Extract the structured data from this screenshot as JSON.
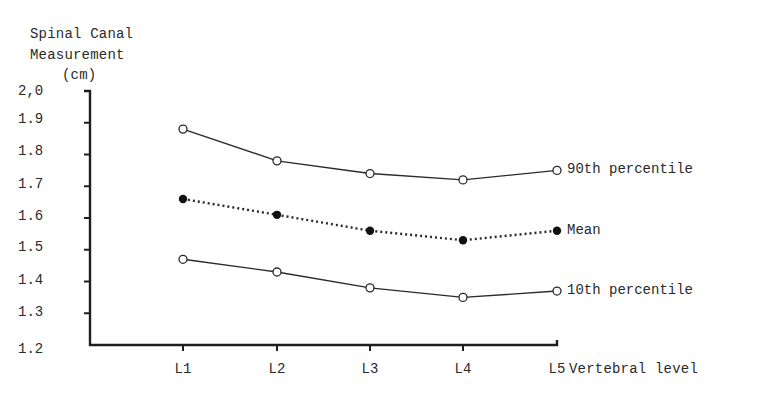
{
  "chart_data": {
    "type": "line",
    "title": "",
    "ylabel_lines": [
      "Spinal Canal",
      "Measurement",
      "(cm)"
    ],
    "xlabel": "Vertebral level",
    "categories": [
      "L1",
      "L2",
      "L3",
      "L4",
      "L5"
    ],
    "ylim": [
      1.2,
      2.0
    ],
    "yticks": [
      "2,0",
      "1.9",
      "1.8",
      "1.7",
      "1.6",
      "1.5",
      "1.4",
      "1.3",
      "1.2"
    ],
    "grid": false,
    "legend_position": "inline-right",
    "series": [
      {
        "name": "90th percentile",
        "style": "solid",
        "marker": "open-circle",
        "values": [
          1.88,
          1.78,
          1.74,
          1.72,
          1.75
        ]
      },
      {
        "name": "Mean",
        "style": "dotted",
        "marker": "filled-circle",
        "values": [
          1.66,
          1.61,
          1.56,
          1.53,
          1.56
        ]
      },
      {
        "name": "10th percentile",
        "style": "solid",
        "marker": "open-circle",
        "values": [
          1.47,
          1.43,
          1.38,
          1.35,
          1.37
        ]
      }
    ]
  },
  "colors": {
    "line": "#2a2a2a",
    "background": "#ffffff"
  }
}
